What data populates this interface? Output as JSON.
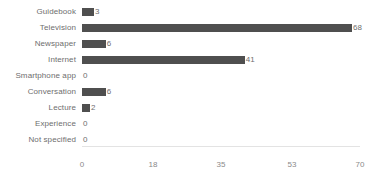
{
  "chart_data": {
    "type": "bar",
    "orientation": "horizontal",
    "title": "",
    "xlabel": "",
    "ylabel": "",
    "grid": false,
    "legend": null,
    "xlim": [
      0,
      70
    ],
    "xticks": [
      "0",
      "18",
      "35",
      "53",
      "70"
    ],
    "xtick_values": [
      0,
      18,
      35,
      53,
      70
    ],
    "categories": [
      "Guidebook",
      "Television",
      "Newspaper",
      "Internet",
      "Smartphone app",
      "Conversation",
      "Lecture",
      "Experience",
      "Not specified"
    ],
    "values": [
      3,
      68,
      6,
      41,
      0,
      6,
      2,
      0,
      0
    ],
    "data_labels": [
      "3",
      "68",
      "6",
      "41",
      "0",
      "6",
      "2",
      "0",
      "0"
    ],
    "bar_color": "#4f4f4f",
    "label_color": "#6e6e6e",
    "tick_color": "#8a8a8a",
    "axis_color": "#e3e3e3",
    "background_color": "#ffffff"
  }
}
